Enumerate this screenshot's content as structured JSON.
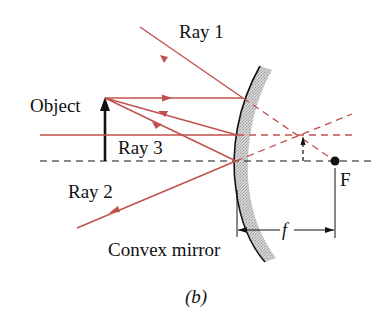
{
  "figure": {
    "caption": "(b)",
    "labels": {
      "ray1": "Ray 1",
      "ray2": "Ray 2",
      "ray3": "Ray 3",
      "object": "Object",
      "focal_point": "F",
      "focal_length": "f",
      "mirror": "Convex mirror"
    },
    "colors": {
      "ray": "#c0504d",
      "mirror_fill": "#c8c8c8",
      "ink": "#111111",
      "background": "#ffffff"
    }
  }
}
